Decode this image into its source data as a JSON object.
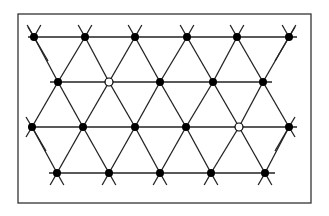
{
  "diagram": {
    "type": "triangular-lattice",
    "colors": {
      "background": "#ffffff",
      "line": "#222222",
      "frame": "#333333",
      "filled_node": "#000000",
      "open_node_fill": "#ffffff"
    },
    "frame": {
      "x": 18,
      "y": 14,
      "width": 293,
      "height": 189
    },
    "rows": [
      {
        "y": 37,
        "line_x": [
          28,
          297
        ],
        "nodes": [
          {
            "x": 34,
            "open": false
          },
          {
            "x": 85,
            "open": false
          },
          {
            "x": 135,
            "open": false
          },
          {
            "x": 187,
            "open": false
          },
          {
            "x": 237,
            "open": false
          },
          {
            "x": 289,
            "open": false
          }
        ]
      },
      {
        "y": 82,
        "line_x": [
          50,
          272
        ],
        "nodes": [
          {
            "x": 58,
            "open": false
          },
          {
            "x": 109,
            "open": true
          },
          {
            "x": 160,
            "open": false
          },
          {
            "x": 213,
            "open": false
          },
          {
            "x": 263,
            "open": false
          }
        ]
      },
      {
        "y": 127,
        "line_x": [
          28,
          297
        ],
        "nodes": [
          {
            "x": 32,
            "open": false
          },
          {
            "x": 83,
            "open": false
          },
          {
            "x": 135,
            "open": false
          },
          {
            "x": 186,
            "open": false
          },
          {
            "x": 239,
            "open": true
          },
          {
            "x": 289,
            "open": false
          }
        ]
      },
      {
        "y": 173,
        "line_x": [
          49,
          275
        ],
        "nodes": [
          {
            "x": 57,
            "open": false
          },
          {
            "x": 109,
            "open": false
          },
          {
            "x": 160,
            "open": false
          },
          {
            "x": 211,
            "open": false
          },
          {
            "x": 265,
            "open": false
          }
        ]
      }
    ],
    "node_radius": 4,
    "open_node_count": 2,
    "filled_node_count": 20
  }
}
